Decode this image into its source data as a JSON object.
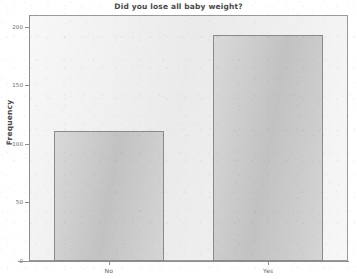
{
  "chart_data": {
    "type": "bar",
    "title": "Did you lose all baby weight?",
    "xlabel": "",
    "ylabel": "Frequency",
    "categories": [
      "No",
      "Yes"
    ],
    "values": [
      111,
      193
    ],
    "ylim": [
      0,
      210
    ],
    "yticks": [
      0,
      50,
      100,
      150,
      200
    ],
    "ytick_labels": [
      "0",
      "50",
      "100",
      "150",
      "200"
    ],
    "grid": false,
    "legend": false,
    "legend_position": "none",
    "colors": {
      "bar_fill": "#c9c9c9",
      "bar_border": "#8a8a8a",
      "plot_background": "#efefef",
      "axis": "#8e8e8e",
      "title_text": "#4a4a4a",
      "tick_text": "#6a6a6a",
      "page_background": "#ffffff"
    }
  }
}
